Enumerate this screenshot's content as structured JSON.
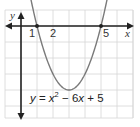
{
  "chart_data": {
    "type": "line",
    "title": "",
    "equation": "y = x² − 6x + 5",
    "equation_parts": {
      "y": "y",
      "eq": " = ",
      "x1": "x",
      "sup": "2",
      "rest1": " − 6",
      "x2": "x",
      "rest2": " + 5"
    },
    "xlabel": "x",
    "ylabel": "y",
    "x_tick_labels": [
      "1",
      "2",
      "5"
    ],
    "x_ticks": [
      1,
      2,
      5
    ],
    "xlim": [
      -1,
      6.9
    ],
    "ylim": [
      -5.8,
      1
    ],
    "grid": true,
    "grid_unit_px": 16,
    "origin_px": [
      21,
      26
    ],
    "series": [
      {
        "name": "y = x^2 - 6x + 5",
        "x": [
          0.4,
          0.5,
          1,
          1.5,
          2,
          2.5,
          3,
          3.5,
          4,
          4.5,
          5,
          5.5,
          5.6
        ],
        "y": [
          2.76,
          2.25,
          0,
          -1.75,
          -3,
          -3.75,
          -4,
          -3.75,
          -3,
          -1.75,
          0,
          2.25,
          2.76
        ]
      }
    ],
    "points": [
      {
        "x": 1,
        "y": 0,
        "label": "1"
      },
      {
        "x": 5,
        "y": 0,
        "label": "5"
      }
    ],
    "vertex": {
      "x": 3,
      "y": -4
    }
  },
  "colors": {
    "grid": "#d6d6d6",
    "axis": "#222222",
    "curve": "#7a7a7a",
    "text": "#333333"
  }
}
